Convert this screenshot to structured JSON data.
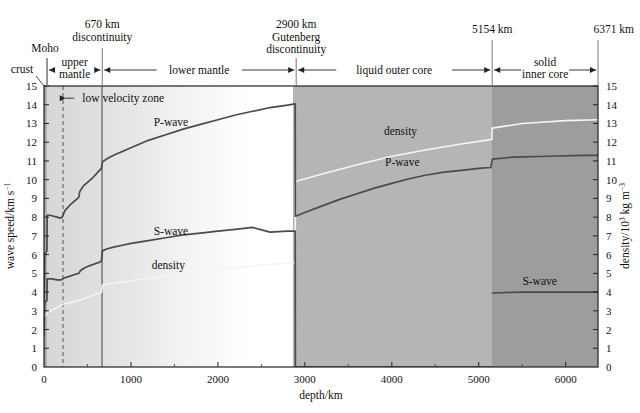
{
  "figure": {
    "axis_left_title": "wave speed/km s",
    "axis_left_title_sup": "−1",
    "axis_right_title_a": "density/10",
    "axis_right_title_sup": "3",
    "axis_right_title_b": " kg m",
    "axis_right_title_sup2": "−3",
    "axis_bottom_title": "depth/km"
  },
  "header": {
    "annotations": [
      {
        "name": "moho",
        "label": "Moho",
        "depth_km": 35
      },
      {
        "name": "discontinuity-670",
        "line1": "670 km",
        "line2": "discontinuity",
        "depth_km": 670
      },
      {
        "name": "gutenberg",
        "line1": "2900 km",
        "line2": "Gutenberg",
        "line3": "discontinuity",
        "depth_km": 2900
      },
      {
        "name": "inner-core-boundary",
        "line1": "5154 km",
        "depth_km": 5154
      },
      {
        "name": "earth-radius",
        "line1": "6371 km",
        "depth_km": 6371
      }
    ],
    "zones": [
      {
        "name": "crust",
        "label": "crust",
        "from_km": 0,
        "to_km": 35
      },
      {
        "name": "upper-mantle",
        "line1": "upper",
        "line2": "mantle",
        "from_km": 35,
        "to_km": 670
      },
      {
        "name": "lower-mantle",
        "label": "lower mantle",
        "from_km": 670,
        "to_km": 2900
      },
      {
        "name": "liquid-outer-core",
        "label": "liquid outer core",
        "from_km": 2900,
        "to_km": 5154
      },
      {
        "name": "solid-inner-core",
        "line1": "solid",
        "line2": "inner core",
        "from_km": 5154,
        "to_km": 6371
      }
    ]
  },
  "plot_annotations": [
    {
      "name": "low-velocity-zone",
      "label": "low velocity zone",
      "x_km": 440,
      "y": 14.35
    },
    {
      "name": "p-wave-label-mantle",
      "label": "P-wave",
      "x_km": 1460,
      "y": 13.1
    },
    {
      "name": "s-wave-label-mantle",
      "label": "S-wave",
      "x_km": 1460,
      "y": 7.25
    },
    {
      "name": "density-label-mantle",
      "label": "density",
      "x_km": 1430,
      "y": 5.45
    },
    {
      "name": "density-label-core",
      "label": "density",
      "x_km": 4100,
      "y": 12.6
    },
    {
      "name": "p-wave-label-core",
      "label": "P-wave",
      "x_km": 4120,
      "y": 10.95
    },
    {
      "name": "s-wave-label-core",
      "label": "S-wave",
      "x_km": 5700,
      "y": 4.6
    }
  ],
  "chart_data": {
    "type": "line",
    "title": "",
    "xlabel": "depth/km",
    "ylabel": "wave speed/km s⁻¹",
    "y2label": "density/10³ kg m⁻³",
    "xlim": [
      0,
      6371
    ],
    "ylim": [
      0,
      15
    ],
    "y2lim": [
      0,
      15
    ],
    "xticks": [
      0,
      1000,
      2000,
      3000,
      4000,
      5000,
      6000
    ],
    "xtick_labels": [
      "0",
      "1000",
      "2000",
      "3000",
      "4000",
      "5000",
      "6000"
    ],
    "yticks": [
      0,
      1,
      2,
      3,
      4,
      5,
      6,
      7,
      8,
      9,
      10,
      11,
      12,
      13,
      14,
      15
    ],
    "ytick_labels": [
      "0",
      "1",
      "2",
      "3",
      "4",
      "5",
      "6",
      "7",
      "8",
      "9",
      "10",
      "11",
      "12",
      "13",
      "14",
      "15"
    ],
    "y2ticks": [
      0,
      1,
      2,
      3,
      4,
      5,
      6,
      7,
      8,
      9,
      10,
      11,
      12,
      13,
      14,
      15
    ],
    "grid": false,
    "legend": "inline-curve-labels",
    "boundaries_km": [
      35,
      220,
      670,
      2900,
      5154
    ],
    "series": [
      {
        "name": "P-wave",
        "color": "#4a4a4a",
        "unit": "km s^-1",
        "points": [
          [
            0,
            2.9
          ],
          [
            8,
            6.0
          ],
          [
            20,
            6.1
          ],
          [
            34,
            6.2
          ],
          [
            36,
            8.1
          ],
          [
            70,
            8.1
          ],
          [
            110,
            8.05
          ],
          [
            150,
            8.0
          ],
          [
            185,
            7.95
          ],
          [
            210,
            8.0
          ],
          [
            240,
            8.35
          ],
          [
            300,
            8.65
          ],
          [
            350,
            8.85
          ],
          [
            400,
            9.05
          ],
          [
            410,
            9.35
          ],
          [
            450,
            9.65
          ],
          [
            500,
            9.85
          ],
          [
            560,
            10.1
          ],
          [
            620,
            10.4
          ],
          [
            660,
            10.6
          ],
          [
            672,
            10.95
          ],
          [
            720,
            11.1
          ],
          [
            800,
            11.3
          ],
          [
            900,
            11.5
          ],
          [
            1000,
            11.7
          ],
          [
            1200,
            12.1
          ],
          [
            1400,
            12.4
          ],
          [
            1600,
            12.7
          ],
          [
            1800,
            12.95
          ],
          [
            2000,
            13.2
          ],
          [
            2200,
            13.45
          ],
          [
            2400,
            13.65
          ],
          [
            2600,
            13.85
          ],
          [
            2800,
            13.98
          ],
          [
            2889,
            14.05
          ],
          [
            2891,
            8.05
          ],
          [
            3000,
            8.25
          ],
          [
            3200,
            8.6
          ],
          [
            3400,
            8.95
          ],
          [
            3600,
            9.25
          ],
          [
            3800,
            9.55
          ],
          [
            4000,
            9.8
          ],
          [
            4200,
            10.05
          ],
          [
            4400,
            10.25
          ],
          [
            4600,
            10.4
          ],
          [
            4800,
            10.5
          ],
          [
            5000,
            10.6
          ],
          [
            5140,
            10.65
          ],
          [
            5155,
            11.1
          ],
          [
            5400,
            11.2
          ],
          [
            5800,
            11.25
          ],
          [
            6200,
            11.3
          ],
          [
            6371,
            11.3
          ]
        ]
      },
      {
        "name": "S-wave",
        "color": "#4a4a4a",
        "unit": "km s^-1",
        "points": [
          [
            0,
            1.7
          ],
          [
            8,
            3.4
          ],
          [
            20,
            3.5
          ],
          [
            34,
            3.55
          ],
          [
            36,
            4.7
          ],
          [
            90,
            4.7
          ],
          [
            150,
            4.65
          ],
          [
            200,
            4.65
          ],
          [
            230,
            4.75
          ],
          [
            300,
            4.85
          ],
          [
            360,
            4.95
          ],
          [
            400,
            5.0
          ],
          [
            420,
            5.15
          ],
          [
            470,
            5.3
          ],
          [
            520,
            5.4
          ],
          [
            580,
            5.5
          ],
          [
            640,
            5.6
          ],
          [
            660,
            5.65
          ],
          [
            672,
            6.2
          ],
          [
            720,
            6.3
          ],
          [
            800,
            6.4
          ],
          [
            900,
            6.5
          ],
          [
            1000,
            6.6
          ],
          [
            1200,
            6.75
          ],
          [
            1400,
            6.9
          ],
          [
            1600,
            7.05
          ],
          [
            1800,
            7.15
          ],
          [
            2000,
            7.25
          ],
          [
            2200,
            7.35
          ],
          [
            2400,
            7.45
          ],
          [
            2600,
            7.2
          ],
          [
            2800,
            7.25
          ],
          [
            2889,
            7.25
          ],
          [
            2891,
            0
          ],
          [
            5154,
            0
          ],
          [
            5156,
            3.95
          ],
          [
            5500,
            4.0
          ],
          [
            6000,
            4.0
          ],
          [
            6371,
            4.0
          ]
        ]
      },
      {
        "name": "density",
        "color": "#f0f0f0",
        "unit": "10^3 kg m^-3",
        "points": [
          [
            0,
            2.6
          ],
          [
            35,
            2.9
          ],
          [
            220,
            3.35
          ],
          [
            400,
            3.55
          ],
          [
            660,
            3.99
          ],
          [
            672,
            4.38
          ],
          [
            1000,
            4.6
          ],
          [
            1500,
            4.9
          ],
          [
            2000,
            5.2
          ],
          [
            2500,
            5.45
          ],
          [
            2889,
            5.55
          ],
          [
            2891,
            9.9
          ],
          [
            3200,
            10.3
          ],
          [
            3600,
            10.8
          ],
          [
            4000,
            11.25
          ],
          [
            4400,
            11.6
          ],
          [
            4800,
            11.9
          ],
          [
            5150,
            12.15
          ],
          [
            5155,
            12.75
          ],
          [
            5500,
            13.0
          ],
          [
            6000,
            13.15
          ],
          [
            6371,
            13.2
          ]
        ]
      }
    ]
  }
}
